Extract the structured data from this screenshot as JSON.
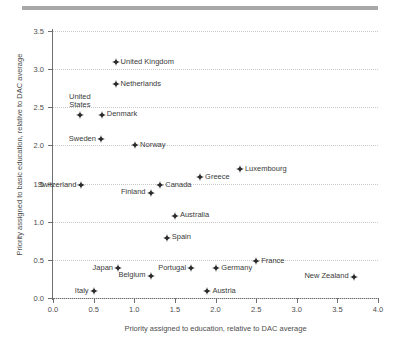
{
  "figure": {
    "top_rule_color": "#a8a8a8",
    "marker_color": "#2b2b2b",
    "grid_color": "#c9c9c9",
    "axis_color": "#6e6e6e"
  },
  "chart_data": {
    "type": "scatter",
    "title": "",
    "xlabel": "Priority assigned to education, relative to DAC average",
    "ylabel": "Priority assigned to basic education, relative to DAC average",
    "xlim": [
      0.0,
      4.0
    ],
    "ylim": [
      0.0,
      3.5
    ],
    "xticks": [
      "0.0",
      "0.5",
      "1.0",
      "1.5",
      "2.0",
      "2.5",
      "3.0",
      "3.5",
      "4.0"
    ],
    "xtick_values": [
      0.0,
      0.5,
      1.0,
      1.5,
      2.0,
      2.5,
      3.0,
      3.5,
      4.0
    ],
    "yticks": [
      "0.0",
      "0.5",
      "1.0",
      "1.5",
      "2.0",
      "2.5",
      "3.0",
      "3.5"
    ],
    "ytick_values": [
      0.0,
      0.5,
      1.0,
      1.5,
      2.0,
      2.5,
      3.0,
      3.5
    ],
    "grid": "horizontal-dotted",
    "legend": "none",
    "points": [
      {
        "label": "United Kingdom",
        "x": 0.77,
        "y": 3.09,
        "label_pos": "right"
      },
      {
        "label": "Netherlands",
        "x": 0.77,
        "y": 2.8,
        "label_pos": "right"
      },
      {
        "label": "United States",
        "x": 0.33,
        "y": 2.4,
        "label_pos": "above",
        "label_line1": "United",
        "label_line2": "States"
      },
      {
        "label": "Denmark",
        "x": 0.6,
        "y": 2.4,
        "label_pos": "right"
      },
      {
        "label": "Sweden",
        "x": 0.59,
        "y": 2.08,
        "label_pos": "left"
      },
      {
        "label": "Norway",
        "x": 1.01,
        "y": 2.0,
        "label_pos": "right"
      },
      {
        "label": "Luxembourg",
        "x": 2.3,
        "y": 1.69,
        "label_pos": "right"
      },
      {
        "label": "Greece",
        "x": 1.81,
        "y": 1.58,
        "label_pos": "right"
      },
      {
        "label": "Switzerland",
        "x": 0.35,
        "y": 1.48,
        "label_pos": "left"
      },
      {
        "label": "Canada",
        "x": 1.32,
        "y": 1.48,
        "label_pos": "right"
      },
      {
        "label": "Finland",
        "x": 1.2,
        "y": 1.38,
        "label_pos": "left"
      },
      {
        "label": "Australia",
        "x": 1.5,
        "y": 1.08,
        "label_pos": "right"
      },
      {
        "label": "Spain",
        "x": 1.4,
        "y": 0.79,
        "label_pos": "right"
      },
      {
        "label": "France",
        "x": 2.5,
        "y": 0.48,
        "label_pos": "right"
      },
      {
        "label": "Japan",
        "x": 0.8,
        "y": 0.39,
        "label_pos": "left"
      },
      {
        "label": "Portugal",
        "x": 1.7,
        "y": 0.39,
        "label_pos": "left"
      },
      {
        "label": "Germany",
        "x": 2.01,
        "y": 0.39,
        "label_pos": "right"
      },
      {
        "label": "Belgium",
        "x": 1.2,
        "y": 0.29,
        "label_pos": "left"
      },
      {
        "label": "New Zealand",
        "x": 3.7,
        "y": 0.28,
        "label_pos": "left"
      },
      {
        "label": "Italy",
        "x": 0.5,
        "y": 0.09,
        "label_pos": "left"
      },
      {
        "label": "Austria",
        "x": 1.9,
        "y": 0.09,
        "label_pos": "right"
      }
    ]
  }
}
